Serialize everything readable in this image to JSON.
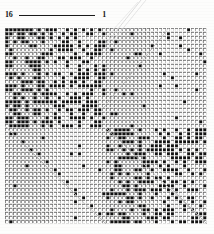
{
  "figure": {
    "type": "binary-matrix-plot",
    "scale": {
      "left_label": "16",
      "right_label": "1",
      "rule": "horizontal-rule"
    },
    "grid": {
      "columns": 50,
      "rows": 49,
      "cell_size_px": 4,
      "cell_gap_px": 1,
      "split_column": 25,
      "split_row": 25,
      "colors": {
        "filled": "#121212",
        "empty": "#ffffff",
        "cell_border": "#6e6e6e",
        "background": "#fdfdfc",
        "diagonal_line": "#b4b4b4",
        "leader_line": "#d2d2d2"
      },
      "quadrants": [
        {
          "name": "top-left",
          "density": "dense",
          "fill_ratio": 0.46
        },
        {
          "name": "top-right",
          "density": "sparse",
          "fill_ratio": 0.035
        },
        {
          "name": "bottom-left",
          "density": "sparse",
          "fill_ratio": 0.03
        },
        {
          "name": "bottom-right",
          "density": "dense",
          "fill_ratio": 0.44
        }
      ],
      "diagonals": [
        {
          "from": "top-right-corner-of-top-right-quadrant",
          "to": "bottom-left",
          "style": "faint"
        },
        {
          "from": "top-left-of-bottom-right-quadrant",
          "to": "bottom-right",
          "style": "faint"
        },
        {
          "from": "top-left-of-bottom-left-quadrant",
          "to": "bottom-right-of-bottom-left-quadrant",
          "style": "faint-dotted"
        }
      ]
    }
  },
  "chart_data": {
    "type": "heatmap",
    "title": "",
    "subtitle": "",
    "xlabel": "",
    "ylabel": "",
    "grid": true,
    "legend": "none",
    "axis_scale_labels": [
      "16",
      "1"
    ],
    "ncols": 50,
    "nrows": 49,
    "xlim": [
      0,
      50
    ],
    "ylim": [
      0,
      49
    ],
    "value_legend": {
      "0": "empty cell (white)",
      "1": "filled cell (black)"
    },
    "block_structure": {
      "top_left": {
        "cols": [
          0,
          24
        ],
        "rows": [
          0,
          24
        ],
        "mean_value": 0.46
      },
      "top_right": {
        "cols": [
          25,
          49
        ],
        "rows": [
          0,
          24
        ],
        "mean_value": 0.035
      },
      "bottom_left": {
        "cols": [
          0,
          24
        ],
        "rows": [
          25,
          48
        ],
        "mean_value": 0.03
      },
      "bottom_right": {
        "cols": [
          25,
          49
        ],
        "rows": [
          25,
          48
        ],
        "mean_value": 0.44
      }
    },
    "sparse_marks_top_right": [
      [
        31,
        1
      ],
      [
        40,
        2
      ],
      [
        27,
        3
      ],
      [
        36,
        4
      ],
      [
        45,
        5
      ],
      [
        30,
        7
      ],
      [
        49,
        8
      ],
      [
        33,
        9
      ],
      [
        26,
        11
      ],
      [
        41,
        12
      ],
      [
        38,
        14
      ],
      [
        47,
        15
      ],
      [
        29,
        16
      ],
      [
        44,
        18
      ],
      [
        34,
        19
      ],
      [
        27,
        21
      ],
      [
        42,
        22
      ],
      [
        48,
        23
      ],
      [
        31,
        24
      ]
    ],
    "sparse_marks_bottom_left": [
      [
        2,
        26
      ],
      [
        4,
        28
      ],
      [
        6,
        30
      ],
      [
        8,
        31
      ],
      [
        10,
        33
      ],
      [
        12,
        35
      ],
      [
        13,
        36
      ],
      [
        15,
        38
      ],
      [
        17,
        40
      ],
      [
        19,
        42
      ],
      [
        21,
        44
      ],
      [
        23,
        46
      ],
      [
        9,
        27
      ],
      [
        18,
        31
      ]
    ]
  }
}
